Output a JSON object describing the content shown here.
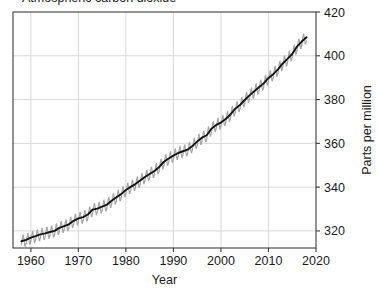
{
  "figure": {
    "clipped_title": "Atmospheric carbon dioxide",
    "plot": {
      "x_left": 13,
      "x_right": 316,
      "y_top": 12,
      "y_bottom": 248
    }
  },
  "chart_data": {
    "type": "line",
    "title": "",
    "xlabel": "Year",
    "ylabel": "Parts per million",
    "xlim": [
      1956.25,
      2020
    ],
    "ylim": [
      312.2,
      420
    ],
    "xticks": [
      1960,
      1970,
      1980,
      1990,
      2000,
      2010,
      2020
    ],
    "xticklabels": [
      "1960",
      "1970",
      "1980",
      "1990",
      "2000",
      "2010",
      "2020"
    ],
    "yticks": [
      320,
      340,
      360,
      380,
      400,
      420
    ],
    "yticklabels": [
      "320",
      "340",
      "360",
      "380",
      "400",
      "420"
    ],
    "grid": true,
    "grid_color": "#d9d9d9",
    "y_axis_position": "right",
    "legend": null,
    "series": [
      {
        "name": "Monthly mean CO2 (seasonal cycle)",
        "color": "#9a9a9a",
        "style": "oscillation",
        "seasonal_amplitude_ppm": 3.1,
        "note": "sawtooth annual cycle about the trend"
      },
      {
        "name": "Smoothed trend",
        "color": "#141414",
        "style": "line",
        "x": [
          1958,
          1959,
          1960,
          1961,
          1962,
          1963,
          1964,
          1965,
          1966,
          1967,
          1968,
          1969,
          1970,
          1971,
          1972,
          1973,
          1974,
          1975,
          1976,
          1977,
          1978,
          1979,
          1980,
          1981,
          1982,
          1983,
          1984,
          1985,
          1986,
          1987,
          1988,
          1989,
          1990,
          1991,
          1992,
          1993,
          1994,
          1995,
          1996,
          1997,
          1998,
          1999,
          2000,
          2001,
          2002,
          2003,
          2004,
          2005,
          2006,
          2007,
          2008,
          2009,
          2010,
          2011,
          2012,
          2013,
          2014,
          2015,
          2016,
          2017,
          2018
        ],
        "values": [
          315.3,
          315.9,
          316.9,
          317.6,
          318.4,
          318.9,
          319.5,
          320.0,
          321.4,
          322.2,
          323.0,
          324.6,
          325.7,
          326.3,
          327.5,
          329.7,
          330.2,
          331.1,
          332.0,
          333.8,
          335.4,
          336.8,
          338.7,
          340.1,
          341.4,
          343.0,
          344.6,
          346.0,
          347.4,
          349.2,
          351.6,
          353.1,
          354.4,
          355.6,
          356.4,
          357.1,
          358.8,
          360.8,
          362.6,
          363.7,
          366.7,
          368.4,
          369.5,
          371.1,
          373.2,
          375.8,
          377.5,
          379.8,
          381.9,
          383.8,
          385.6,
          387.4,
          389.9,
          391.6,
          393.8,
          396.5,
          398.6,
          400.8,
          404.2,
          406.5,
          408.5
        ]
      }
    ]
  }
}
